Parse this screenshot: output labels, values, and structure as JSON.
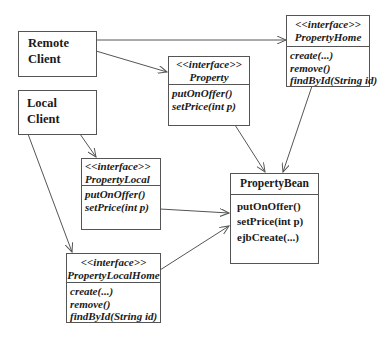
{
  "clients": {
    "remote": {
      "line1": "Remote",
      "line2": "Client"
    },
    "local": {
      "line1": "Local",
      "line2": "Client"
    }
  },
  "interfaces": {
    "property": {
      "stereotype": "<<interface>>",
      "name": "Property",
      "operations": [
        "putOnOffer()",
        "setPrice(int p)"
      ]
    },
    "property_home": {
      "stereotype": "<<interface>>",
      "name": "PropertyHome",
      "operations": [
        "create(...)",
        "remove()",
        "findById(String id)"
      ]
    },
    "property_local": {
      "stereotype": "<<interface>>",
      "name": "PropertyLocal",
      "operations": [
        "putOnOffer()",
        "setPrice(int p)"
      ]
    },
    "property_local_home": {
      "stereotype": "<<interface>>",
      "name": "PropertyLocalHome",
      "operations": [
        "create(...)",
        "remove()",
        "findById(String id)"
      ]
    }
  },
  "bean": {
    "name": "PropertyBean",
    "operations": [
      "putOnOffer()",
      "setPrice(int p)",
      "ejbCreate(...)"
    ]
  },
  "edges": [
    {
      "from": "Remote Client",
      "to": "PropertyHome"
    },
    {
      "from": "Remote Client",
      "to": "Property"
    },
    {
      "from": "Local Client",
      "to": "PropertyLocal"
    },
    {
      "from": "Local Client",
      "to": "PropertyLocalHome"
    },
    {
      "from": "Property",
      "to": "PropertyBean"
    },
    {
      "from": "PropertyHome",
      "to": "PropertyBean"
    },
    {
      "from": "PropertyLocal",
      "to": "PropertyBean"
    },
    {
      "from": "PropertyLocalHome",
      "to": "PropertyBean"
    }
  ],
  "colors": {
    "line": "#555555",
    "text": "#1a1a1a",
    "background": "#ffffff"
  }
}
